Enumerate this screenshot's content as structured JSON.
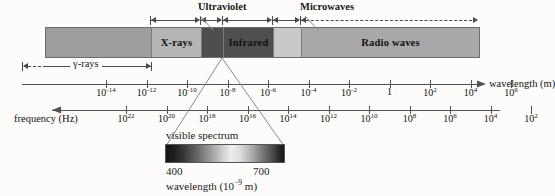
{
  "diagram": {
    "bands": [
      {
        "name": "gamma-xray-left",
        "label": "",
        "color": "#9d9d9d",
        "width_px": 105
      },
      {
        "name": "x-rays",
        "label": "X-rays",
        "color": "#b5b5b5",
        "width_px": 50
      },
      {
        "name": "ultraviolet",
        "label": "",
        "color": "#4d4d4d",
        "width_px": 22
      },
      {
        "name": "infrared",
        "label": "Infrared",
        "color": "#4f4f4f",
        "width_px": 50
      },
      {
        "name": "microwaves",
        "label": "",
        "color": "#c9c9c9",
        "width_px": 28
      },
      {
        "name": "radio-waves",
        "label": "Radio waves",
        "color": "#a8a8a8",
        "width_px": 178
      }
    ],
    "callouts": [
      {
        "name": "ultraviolet",
        "label": "Ultraviolet",
        "x": 198,
        "y": 2
      },
      {
        "name": "microwaves",
        "label": "Microwaves",
        "x": 300,
        "y": 2
      }
    ],
    "gamma_rays": {
      "label": "γ-rays"
    },
    "wavelength_axis": {
      "caption": "wavelength (m)",
      "ticks": [
        "10−14",
        "10−12",
        "10−10",
        "10−8",
        "10−6",
        "10−4",
        "10−2",
        "1",
        "10²",
        "10⁴",
        "10⁶"
      ],
      "tick_bases": [
        "10",
        "10",
        "10",
        "10",
        "10",
        "10",
        "10",
        "1",
        "10",
        "10",
        "10"
      ],
      "tick_exps": [
        "-14",
        "-12",
        "-10",
        "-8",
        "-6",
        "-4",
        "-2",
        "",
        "2",
        "4",
        "6"
      ],
      "direction": "right"
    },
    "frequency_axis": {
      "caption": "frequency (Hz)",
      "ticks": [
        "10²²",
        "10²⁰",
        "10¹⁸",
        "10¹⁶",
        "10¹⁴",
        "10¹²",
        "10¹⁰",
        "10⁸",
        "10⁶",
        "10⁴",
        "10²"
      ],
      "tick_bases": [
        "10",
        "10",
        "10",
        "10",
        "10",
        "10",
        "10",
        "10",
        "10",
        "10",
        "10"
      ],
      "tick_exps": [
        "22",
        "20",
        "18",
        "16",
        "14",
        "12",
        "10",
        "8",
        "6",
        "4",
        "2"
      ],
      "direction": "left"
    },
    "visible_spectrum": {
      "label": "visible spectrum",
      "min_label": "400",
      "max_label": "700",
      "caption_base": "wavelength (10",
      "caption_exp": "−9",
      "caption_tail": " m)"
    }
  },
  "colors": {
    "page_background": "#fdfcfa",
    "bar_outline": "#6e6e6e",
    "axis": "#55534f",
    "text": "#1a1a1a"
  }
}
